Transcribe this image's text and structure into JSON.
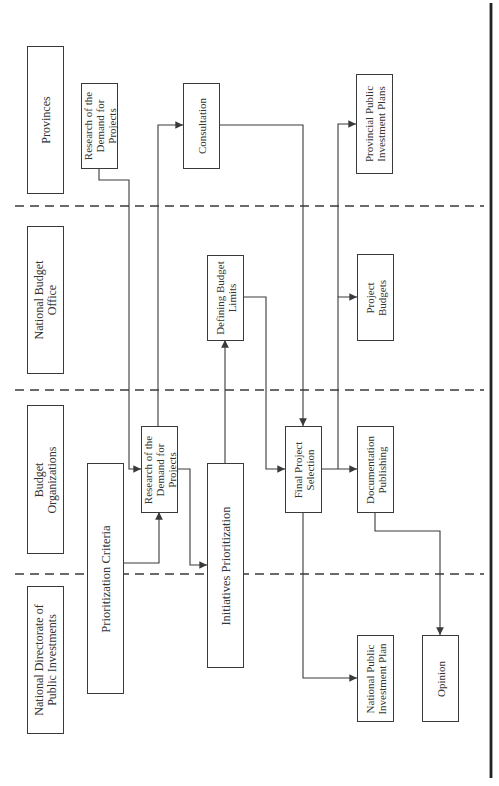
{
  "diagram": {
    "orientation": "rotated-90-ccw",
    "lanes": [
      {
        "id": "provinces",
        "label": "Provinces"
      },
      {
        "id": "national-budget-office",
        "label": "National Budget\nOffice"
      },
      {
        "id": "budget-organizations",
        "label": "Budget\nOrganizations"
      },
      {
        "id": "national-directorate",
        "label": "National Directorate of\nPublic Investments"
      }
    ],
    "nodes": {
      "research_provinces": "Research of the\nDemand for\nProjects",
      "consultation": "Consultation",
      "provincial_plans": "Provincial Public\nInvestment Plans",
      "defining_budget_limits": "Defining Budget\nLimits",
      "project_budgets": "Project\nBudgets",
      "research_budget_orgs": "Research of the\nDemand for\nProjects",
      "prioritization_criteria": "Prioritization Criteria",
      "initiatives_prioritization": "Initiatives Prioritization",
      "final_project_selection": "Final Project\nSelection",
      "documentation_publishing": "Documentation\nPublishing",
      "national_plan": "National Public\nInvestment Plan",
      "opinion": "Opinion"
    },
    "edges": [
      {
        "from": "research_provinces",
        "to": "research_budget_orgs"
      },
      {
        "from": "prioritization_criteria",
        "to": "research_budget_orgs"
      },
      {
        "from": "research_budget_orgs",
        "to": "initiatives_prioritization"
      },
      {
        "from": "initiatives_prioritization",
        "to": "consultation"
      },
      {
        "from": "initiatives_prioritization",
        "to": "defining_budget_limits"
      },
      {
        "from": "defining_budget_limits",
        "to": "final_project_selection"
      },
      {
        "from": "consultation",
        "to": "final_project_selection"
      },
      {
        "from": "final_project_selection",
        "to": "documentation_publishing"
      },
      {
        "from": "final_project_selection",
        "to": "project_budgets"
      },
      {
        "from": "final_project_selection",
        "to": "provincial_plans"
      },
      {
        "from": "final_project_selection",
        "to": "national_plan"
      },
      {
        "from": "documentation_publishing",
        "to": "opinion"
      }
    ],
    "colors": {
      "line": "#3a3a3a",
      "text": "#333333",
      "background": "#ffffff"
    }
  }
}
